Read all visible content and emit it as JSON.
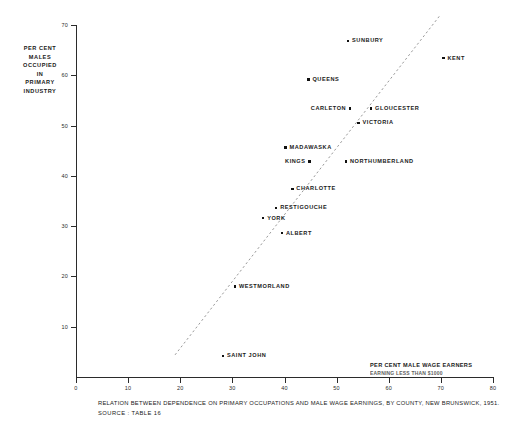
{
  "chart_data": {
    "type": "scatter",
    "title": "RELATION BETWEEN DEPENDENCE ON PRIMARY OCCUPATIONS AND MALE WAGE EARNINGS, BY COUNTY, NEW BRUNSWICK, 1951.",
    "source": "SOURCE : TABLE 16",
    "xlabel": "PER CENT MALE WAGE EARNERS",
    "xlabel_sub": "EARNING LESS THAN $1000",
    "ylabel": "PER CENT MALES OCCUPIED IN PRIMARY INDUSTRY",
    "ylabel_lines": [
      "PER CENT",
      "MALES",
      "OCCUPIED",
      "IN",
      "PRIMARY",
      "INDUSTRY"
    ],
    "xlim": [
      0,
      80
    ],
    "ylim": [
      0,
      70
    ],
    "xticks": [
      0,
      10,
      20,
      30,
      40,
      50,
      60,
      70,
      80
    ],
    "yticks": [
      10,
      20,
      30,
      40,
      50,
      60,
      70
    ],
    "grid": false,
    "legend": false,
    "marker_color": "#111111",
    "axis_color": "#2b2b2b",
    "trendline": {
      "style": "dashed",
      "color": "#9a9a9a",
      "x_start": 19.0,
      "y_start": 4.4,
      "x_end": 69.9,
      "y_end": 72.0
    },
    "points": [
      {
        "label": "SUNBURY",
        "x": 52.2,
        "y": 66.8,
        "label_side": "right"
      },
      {
        "label": "KENT",
        "x": 70.5,
        "y": 63.4,
        "label_side": "right"
      },
      {
        "label": "QUEENS",
        "x": 44.6,
        "y": 59.2,
        "label_side": "right"
      },
      {
        "label": "CARLETON",
        "x": 52.6,
        "y": 53.4,
        "label_side": "left"
      },
      {
        "label": "GLOUCESTER",
        "x": 56.6,
        "y": 53.4,
        "label_side": "right"
      },
      {
        "label": "VICTORIA",
        "x": 54.2,
        "y": 50.5,
        "label_side": "right"
      },
      {
        "label": "MADAWASKA",
        "x": 40.2,
        "y": 45.6,
        "label_side": "right"
      },
      {
        "label": "KINGS",
        "x": 44.8,
        "y": 42.8,
        "label_side": "left"
      },
      {
        "label": "NORTHUMBERLAND",
        "x": 51.8,
        "y": 42.8,
        "label_side": "right"
      },
      {
        "label": "CHARLOTTE",
        "x": 41.5,
        "y": 37.4,
        "label_side": "right"
      },
      {
        "label": "RESTIGOUCHE",
        "x": 38.4,
        "y": 33.6,
        "label_side": "right"
      },
      {
        "label": "YORK",
        "x": 35.9,
        "y": 31.6,
        "label_side": "right"
      },
      {
        "label": "ALBERT",
        "x": 39.5,
        "y": 28.6,
        "label_side": "right"
      },
      {
        "label": "WESTMORLAND",
        "x": 30.5,
        "y": 18.0,
        "label_side": "right"
      },
      {
        "label": "SAINT JOHN",
        "x": 28.2,
        "y": 4.2,
        "label_side": "right"
      }
    ]
  }
}
